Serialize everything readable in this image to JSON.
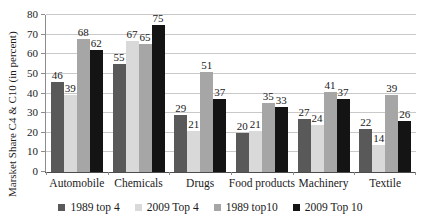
{
  "chart_data": {
    "type": "bar",
    "title": "",
    "xlabel": "",
    "ylabel": "Marsket Share C4 & C10 (in percent)",
    "ylim": [
      0,
      80
    ],
    "yticks": [
      0,
      10,
      20,
      30,
      40,
      50,
      60,
      70,
      80
    ],
    "grid": true,
    "legend_position": "bottom",
    "categories": [
      "Automobile",
      "Chemicals",
      "Drugs",
      "Food products",
      "Machinery",
      "Textile"
    ],
    "series": [
      {
        "name": "1989 top 4",
        "color": "#595959",
        "values": [
          46,
          55,
          29,
          20,
          27,
          22
        ]
      },
      {
        "name": "2009 Top 4",
        "color": "#d9d9d9",
        "values": [
          39,
          67,
          21,
          21,
          24,
          14
        ]
      },
      {
        "name": "1989 top10",
        "color": "#a6a6a6",
        "values": [
          68,
          65,
          51,
          35,
          41,
          39
        ]
      },
      {
        "name": "2009 Top 10",
        "color": "#141414",
        "values": [
          62,
          75,
          37,
          33,
          37,
          26
        ]
      }
    ]
  },
  "colors": {
    "grid": "#c9c9c9",
    "axis": "#8c8c8c",
    "baseline": "#4d4d4d",
    "text": "#1a1a1a",
    "background": "#ffffff"
  }
}
